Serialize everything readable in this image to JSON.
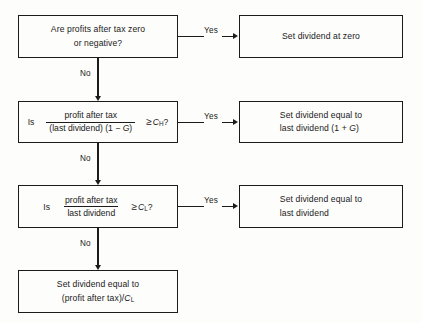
{
  "diagram": {
    "colors": {
      "line": "#1b1b1b",
      "background": "#fdfdfb",
      "text": "#1a1a1a"
    },
    "nodes": {
      "q1": {
        "line1": "Are profits after tax zero",
        "line2": "or negative?"
      },
      "a1": {
        "line1": "Set dividend at zero"
      },
      "q2": {
        "lead": "Is",
        "numerator": "profit after tax",
        "denominator_pre": "(last dividend) (1 − ",
        "denominator_var": "G",
        "denominator_post": ")",
        "operator": "≥",
        "var": "C",
        "var_sub": "H",
        "tail": "?"
      },
      "a2": {
        "line1": "Set dividend equal to",
        "line2_pre": "last dividend (1 + ",
        "line2_var": "G",
        "line2_post": ")"
      },
      "q3": {
        "lead": "Is",
        "numerator": "profit after tax",
        "denominator": "last dividend",
        "operator": "≥",
        "var": "C",
        "var_sub": "L",
        "tail": "?"
      },
      "a3": {
        "line1": "Set dividend equal to",
        "line2": "last dividend"
      },
      "a4": {
        "line1": "Set dividend equal to",
        "line2_pre": "(profit after tax)/",
        "line2_var": "C",
        "line2_sub": "L"
      }
    },
    "edges": {
      "yes1": "Yes",
      "yes2": "Yes",
      "yes3": "Yes",
      "no1": "No",
      "no2": "No",
      "no3": "No"
    }
  }
}
